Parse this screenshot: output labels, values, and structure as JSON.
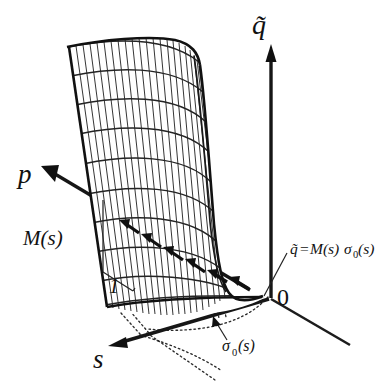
{
  "figure": {
    "kind": "3d-surface-schematic",
    "background_color": "#ffffff",
    "ink_color": "#111111",
    "labels": {
      "axis_q": "q̃",
      "axis_p": "p",
      "axis_s": "s",
      "origin": "0",
      "slope_label": "M(s)",
      "unit_label": "1",
      "surface_equation": "q̃ = M(s)σ₀(s)",
      "surface_equation_parts": {
        "lhs": "q̃",
        "equals": "=",
        "factor": "M(s)",
        "sigma": "σ",
        "sigma_sub": "0",
        "arg": "(s)"
      },
      "sigma_zero_label": "σ₀(s)",
      "sigma_zero_parts": {
        "sigma": "σ",
        "sub": "0",
        "arg": "(s)"
      }
    },
    "annotations": {
      "gradient_arrow_direction": "toward p",
      "dotted_lines_meaning": "projection of surface edges onto base plane",
      "surface_description": "ruled mesh surface rising from base plane"
    }
  }
}
